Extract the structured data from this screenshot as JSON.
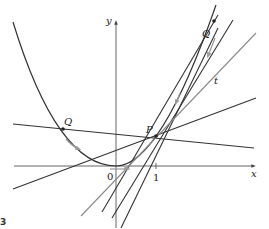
{
  "diagram": {
    "title": "",
    "labels": {
      "y_axis": "y",
      "x_axis": "x",
      "origin": "0",
      "tick_one": "1",
      "point_p": "P",
      "point_q_left": "Q",
      "point_q_right": "Q",
      "tangent": "t",
      "figure_number": "3"
    },
    "colors": {
      "curve": "#333333",
      "secant": "#333333",
      "tangent": "#8a8a8a",
      "axis": "#444444",
      "arrow": "#9a9a9a"
    },
    "elements": {
      "curve": "y = x^2",
      "point_p": [
        1,
        1
      ],
      "secant_lines_count": 5,
      "tangent_line": "t"
    }
  }
}
